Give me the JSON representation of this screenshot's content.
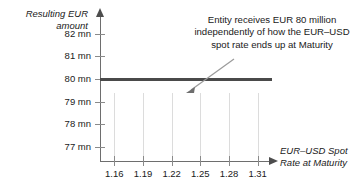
{
  "chart_data": {
    "type": "line",
    "title": "",
    "xlabel": "EUR–USD Spot\nRate at Maturity",
    "ylabel": "Resulting EUR\namount",
    "x_tick_labels": [
      "1.16",
      "1.19",
      "1.22",
      "1.25",
      "1.28",
      "1.31"
    ],
    "x_tick_values": [
      1.16,
      1.19,
      1.22,
      1.25,
      1.28,
      1.31
    ],
    "y_tick_labels": [
      "82 mn",
      "81 mn",
      "80 mn",
      "79 mn",
      "78 mn",
      "77 mn"
    ],
    "y_tick_values": [
      82,
      81,
      80,
      79,
      78,
      77
    ],
    "xlim": [
      1.145,
      1.325
    ],
    "ylim": [
      76.4,
      82.8
    ],
    "grid": "vertical-only",
    "legend": "none",
    "series": [
      {
        "name": "Resulting EUR amount",
        "color": "#4a4a4a",
        "x": [
          1.145,
          1.16,
          1.19,
          1.22,
          1.25,
          1.28,
          1.31,
          1.325
        ],
        "values": [
          80,
          80,
          80,
          80,
          80,
          80,
          80,
          80
        ]
      }
    ],
    "annotations": [
      {
        "text": "Entity receives EUR 80 million independently of how the EUR–USD spot rate ends up at Maturity",
        "points_to_x": 1.24,
        "points_to_y": 80
      }
    ]
  },
  "axes": {
    "y_title": "Resulting EUR\namount",
    "x_title": "EUR–USD Spot\nRate at Maturity"
  },
  "annotation": {
    "text": "Entity receives EUR 80 million independently of how the EUR–USD spot rate ends up at Maturity"
  }
}
